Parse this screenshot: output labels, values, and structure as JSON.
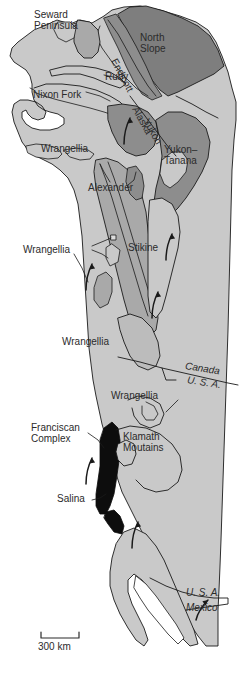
{
  "map": {
    "title": "Terrane map of western North America",
    "scale_bar": {
      "label": "300 km",
      "length_px": 38
    },
    "colors": {
      "background": "#ffffff",
      "craton_light_gray": "#c9c9c9",
      "terrane_mid_gray": "#a9a9a9",
      "terrane_dark_gray": "#7e7e7e",
      "franciscan_black": "#0d0d0d",
      "outline": "#1a1a1a",
      "text": "#2b2b2b"
    },
    "labels": [
      {
        "name": "seward-peninsula",
        "text": "Seward\nPeninsula",
        "x": 34,
        "y": 10,
        "rotate": 0,
        "italic": false
      },
      {
        "name": "north-slope",
        "text": "North\nSlope",
        "x": 140,
        "y": 33,
        "rotate": 0,
        "italic": false
      },
      {
        "name": "endicott",
        "text": "Endicott",
        "x": 118,
        "y": 57,
        "rotate": 62,
        "italic": false
      },
      {
        "name": "ruby",
        "text": "Ruby",
        "x": 105,
        "y": 72,
        "rotate": 0,
        "italic": false
      },
      {
        "name": "nixon-fork",
        "text": "Nixon Fork",
        "x": 33,
        "y": 90,
        "rotate": 0,
        "italic": false
      },
      {
        "name": "alaska",
        "text": "Alaska",
        "x": 148,
        "y": 112,
        "rotate": 61,
        "italic": false
      },
      {
        "name": "yukon",
        "text": "Yukon",
        "x": 158,
        "y": 124,
        "rotate": 61,
        "italic": false
      },
      {
        "name": "wrangellia-alaska",
        "text": "Wrangellia",
        "x": 41,
        "y": 144,
        "rotate": 0,
        "italic": false
      },
      {
        "name": "yukon-tanana",
        "text": "Yukon–\nTanana",
        "x": 164,
        "y": 145,
        "rotate": 0,
        "italic": false
      },
      {
        "name": "alexander",
        "text": "Alexander",
        "x": 88,
        "y": 183,
        "rotate": 0,
        "italic": false
      },
      {
        "name": "wrangellia-bc",
        "text": "Wrangellia",
        "x": 43,
        "y": 245,
        "rotate": 0,
        "italic": false
      },
      {
        "name": "stikine",
        "text": "Stikine",
        "x": 128,
        "y": 243,
        "rotate": 0,
        "italic": false
      },
      {
        "name": "wrangellia-south",
        "text": "Wrangellia",
        "x": 82,
        "y": 337,
        "rotate": 0,
        "italic": false
      },
      {
        "name": "canada",
        "text": "Canada",
        "x": 190,
        "y": 364,
        "rotate": 9,
        "italic": true
      },
      {
        "name": "usa-north",
        "text": "U. S. A.",
        "x": 192,
        "y": 379,
        "rotate": 9,
        "italic": true
      },
      {
        "name": "wrangellia-usa",
        "text": "Wrangellia",
        "x": 131,
        "y": 395,
        "rotate": 0,
        "italic": false
      },
      {
        "name": "franciscan-complex",
        "text": "Franciscan\nComplex",
        "x": 31,
        "y": 423,
        "rotate": 0,
        "italic": false
      },
      {
        "name": "klamath-mountains",
        "text": "Klamath\nMoutains",
        "x": 123,
        "y": 432,
        "rotate": 0,
        "italic": false
      },
      {
        "name": "salina",
        "text": "Salina",
        "x": 60,
        "y": 497,
        "rotate": 0,
        "italic": false
      },
      {
        "name": "usa-south",
        "text": "U. S. A.",
        "x": 188,
        "y": 592,
        "rotate": 0,
        "italic": true
      },
      {
        "name": "mexico",
        "text": "Mexico",
        "x": 188,
        "y": 606,
        "rotate": 0,
        "italic": true
      }
    ]
  }
}
